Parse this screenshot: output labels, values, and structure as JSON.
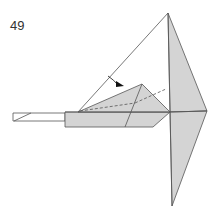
{
  "diagram": {
    "step_number": "49",
    "type": "origami folding step",
    "colors": {
      "paper_gray": "#d4d4d4",
      "paper_white": "#ffffff",
      "line": "#555555",
      "arrow": "#111111"
    },
    "symbols": [
      "valley-fold dashed lines",
      "fold arrow"
    ]
  }
}
